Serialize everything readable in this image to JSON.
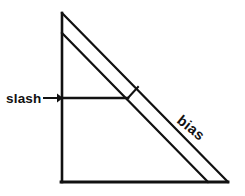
{
  "diagram": {
    "background_color": "#ffffff",
    "line_color": "#111111",
    "labels": {
      "slash": "slash",
      "bias": "bias"
    },
    "annotations": {
      "slash_arrow": "arrow-right",
      "right_angle_marker": "perpendicular-tick"
    },
    "geometry": {
      "apex": [
        62,
        13
      ],
      "bottom_left": [
        62,
        182
      ],
      "bottom_right": [
        228,
        182
      ],
      "inner_diagonal_start": [
        62,
        33
      ],
      "inner_diagonal_end": [
        208,
        182
      ],
      "slash_line_start": [
        62,
        98
      ],
      "slash_line_end": [
        127,
        98
      ],
      "arrow_tail": [
        42,
        98
      ],
      "arrow_head": [
        60,
        98
      ],
      "tick_start": [
        127,
        98
      ],
      "tick_end": [
        138,
        87
      ]
    },
    "text_positions": {
      "slash_x": 6,
      "slash_y": 103,
      "bias_x": 176,
      "bias_y": 122,
      "bias_rotation_deg": 39
    },
    "font_sizes": {
      "slash": 13,
      "bias": 14
    }
  }
}
